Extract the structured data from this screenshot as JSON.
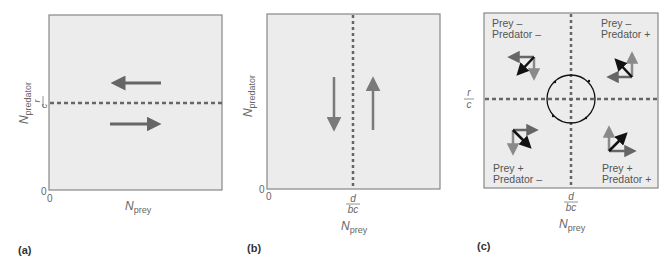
{
  "colors": {
    "panel_fill": "#ececec",
    "panel_border": "#777777",
    "isocline": "#666666",
    "arrow_gray": "#7a7a7a",
    "arrow_dark": "#6a6a6a",
    "arrow_black": "#111111",
    "text": "#666666"
  },
  "panels": {
    "a": {
      "tag": "(a)",
      "y_axis_label_main": "N",
      "y_axis_label_sub": "predator",
      "x_axis_label_main": "N",
      "x_axis_label_sub": "prey",
      "origin_y": "0",
      "origin_x": "0",
      "isocline_label_num": "r",
      "isocline_label_den": "c",
      "arrows": [
        "left-above-isocline",
        "right-below-isocline"
      ]
    },
    "b": {
      "tag": "(b)",
      "y_axis_label_main": "N",
      "y_axis_label_sub": "predator",
      "x_axis_label_main": "N",
      "x_axis_label_sub": "prey",
      "origin_y": "0",
      "origin_x": "0",
      "isocline_label_num": "d",
      "isocline_label_den": "bc",
      "arrows": [
        "down-left-of-isocline",
        "up-right-of-isocline"
      ]
    },
    "c": {
      "tag": "(c)",
      "x_axis_label_main": "N",
      "x_axis_label_sub": "prey",
      "y_isocline_label_num": "r",
      "y_isocline_label_den": "c",
      "x_isocline_label_num": "d",
      "x_isocline_label_den": "bc",
      "quadrants": {
        "top_left": {
          "line1": "Prey –",
          "line2": "Predator –"
        },
        "top_right": {
          "line1": "Prey –",
          "line2": "Predator +"
        },
        "bottom_left": {
          "line1": "Prey +",
          "line2": "Predator –"
        },
        "bottom_right": {
          "line1": "Prey +",
          "line2": "Predator +"
        }
      },
      "cycle": "counterclockwise-equilibrium-circle"
    }
  }
}
